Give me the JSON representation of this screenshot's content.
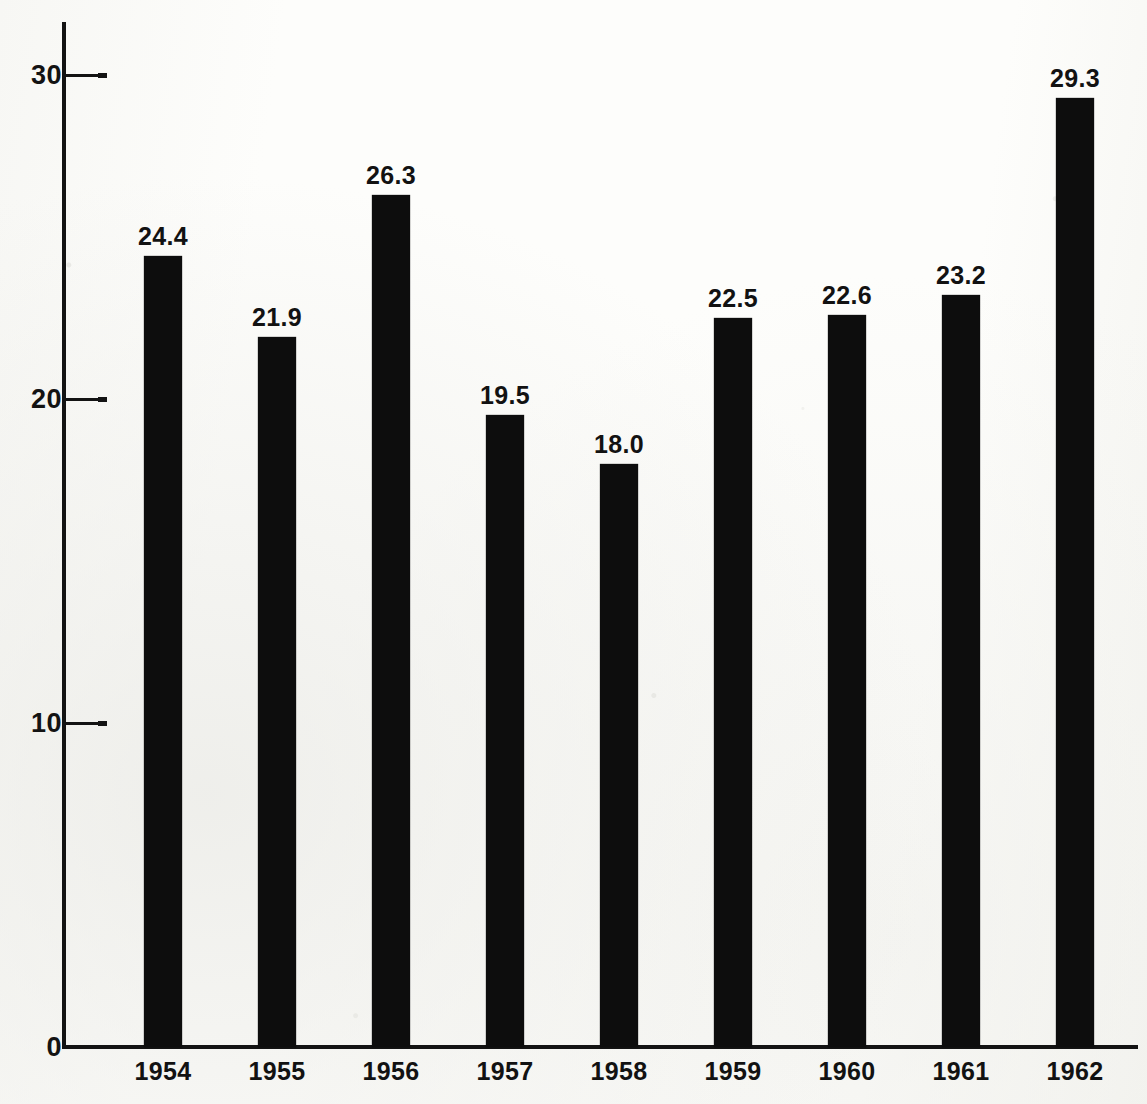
{
  "chart_data": {
    "type": "bar",
    "title": "",
    "subtitle": "",
    "xlabel": "",
    "ylabel": "",
    "categories": [
      "1954",
      "1955",
      "1956",
      "1957",
      "1958",
      "1959",
      "1960",
      "1961",
      "1962"
    ],
    "values": [
      24.4,
      21.9,
      26.3,
      19.5,
      18.0,
      22.5,
      22.6,
      23.2,
      29.3
    ],
    "value_labels": [
      "24.4",
      "21.9",
      "26.3",
      "19.5",
      "18.0",
      "22.5",
      "22.6",
      "23.2",
      "29.3"
    ],
    "ylim": [
      0,
      31.6
    ],
    "yticks": [
      0,
      10,
      20,
      30
    ],
    "ytick_labels": [
      "0",
      "10",
      "20",
      "30"
    ],
    "grid": false,
    "legend": false,
    "legend_position": "none",
    "bar_color": "#0d0d0d",
    "background_color": "#fdfdfb",
    "axis_color": "#131313",
    "annotations": []
  },
  "axis": {
    "y_ticks": [
      {
        "label": "30",
        "value": 30
      },
      {
        "label": "20",
        "value": 20
      },
      {
        "label": "10",
        "value": 10
      },
      {
        "label": "0",
        "value": 0
      }
    ]
  },
  "bars": [
    {
      "year": "1954",
      "label": "24.4",
      "value": 24.4
    },
    {
      "year": "1955",
      "label": "21.9",
      "value": 21.9
    },
    {
      "year": "1956",
      "label": "26.3",
      "value": 26.3
    },
    {
      "year": "1957",
      "label": "19.5",
      "value": 19.5
    },
    {
      "year": "1958",
      "label": "18.0",
      "value": 18.0
    },
    {
      "year": "1959",
      "label": "22.5",
      "value": 22.5
    },
    {
      "year": "1960",
      "label": "22.6",
      "value": 22.6
    },
    {
      "year": "1961",
      "label": "23.2",
      "value": 23.2
    },
    {
      "year": "1962",
      "label": "29.3",
      "value": 29.3
    }
  ]
}
